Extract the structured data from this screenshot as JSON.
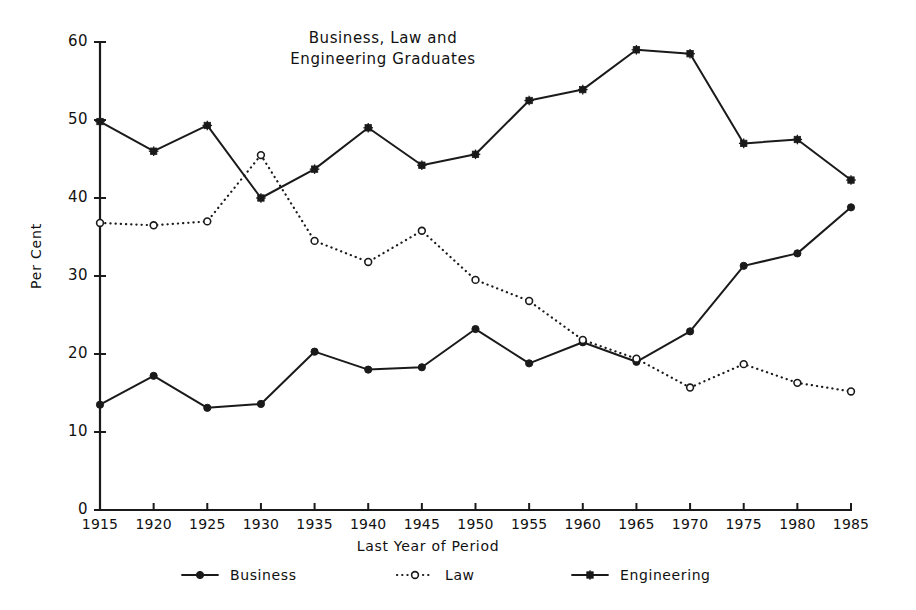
{
  "chart_data": {
    "type": "line",
    "title": "Business, Law and\nEngineering Graduates",
    "xlabel": "Last Year of Period",
    "ylabel": "Per Cent",
    "x": [
      1915,
      1920,
      1925,
      1930,
      1935,
      1940,
      1945,
      1950,
      1955,
      1960,
      1965,
      1970,
      1975,
      1980,
      1985
    ],
    "xtick_labels": [
      "1915",
      "1920",
      "1925",
      "1930",
      "1935",
      "1940",
      "1945",
      "1950",
      "1955",
      "1960",
      "1965",
      "1970",
      "1975",
      "1980",
      "1985"
    ],
    "ytick_labels": [
      "0",
      "10",
      "20",
      "30",
      "40",
      "50",
      "60"
    ],
    "yticks": [
      0,
      10,
      20,
      30,
      40,
      50,
      60
    ],
    "xlim": [
      1915,
      1985
    ],
    "ylim": [
      0,
      60
    ],
    "grid": false,
    "legend_position": "below-axes",
    "series": [
      {
        "name": "Business",
        "marker": "filled-circle",
        "linestyle": "solid",
        "color": "#1a1a1a",
        "values": [
          13.5,
          17.2,
          13.1,
          13.6,
          20.3,
          18.0,
          18.3,
          23.2,
          18.8,
          21.5,
          19.0,
          22.9,
          31.3,
          32.9,
          38.8
        ]
      },
      {
        "name": "Law",
        "marker": "open-circle",
        "linestyle": "dotted",
        "color": "#1a1a1a",
        "values": [
          36.8,
          36.5,
          37.0,
          45.5,
          34.5,
          31.8,
          35.8,
          29.5,
          26.8,
          21.8,
          19.4,
          15.7,
          18.7,
          16.3,
          15.2
        ]
      },
      {
        "name": "Engineering",
        "marker": "star",
        "linestyle": "solid",
        "color": "#1a1a1a",
        "values": [
          49.8,
          46.0,
          49.3,
          40.0,
          43.7,
          49.0,
          44.2,
          45.6,
          52.5,
          53.9,
          59.0,
          58.5,
          47.0,
          47.5,
          42.3
        ]
      }
    ]
  }
}
